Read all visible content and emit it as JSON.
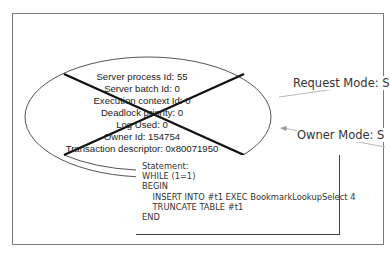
{
  "process_node": {
    "state": "deadlock-victim",
    "lines": [
      "Server process Id: 55",
      "Server batch Id: 0",
      "Execution context Id: 0",
      "Deadlock priority: 0",
      "Log Used: 0",
      "Owner Id: 154754",
      "Transaction descriptor: 0x80071950"
    ]
  },
  "edges": {
    "request_mode": "Request Mode: S",
    "owner_mode": "Owner Mode: S"
  },
  "tooltip": {
    "lines": [
      "Statement:",
      "WHILE (1=1)",
      "BEGIN",
      "    INSERT INTO #t1 EXEC BookmarkLookupSelect 4",
      "    TRUNCATE TABLE #t1",
      "END"
    ]
  },
  "colors": {
    "frame_border": "#7a7a7a",
    "ellipse_stroke": "#555555",
    "victim_cross": "#111111",
    "edge_line": "#b0b0b0",
    "text": "#222222"
  }
}
